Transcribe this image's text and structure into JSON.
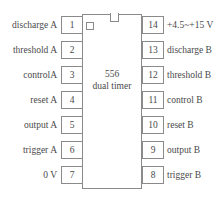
{
  "diagram": {
    "chip": {
      "part_number": "556",
      "description": "dual timer",
      "notch_icon": "notch-indicator",
      "pin1_marker_icon": "pin1-dot-icon"
    },
    "colors": {
      "background": "#ffffff",
      "outline": "#8a8a8a",
      "text": "#4a4a4a"
    },
    "pins_left": [
      {
        "number": "1",
        "label": "discharge A"
      },
      {
        "number": "2",
        "label": "threshold A"
      },
      {
        "number": "3",
        "label": "controlA"
      },
      {
        "number": "4",
        "label": "reset A"
      },
      {
        "number": "5",
        "label": "output A"
      },
      {
        "number": "6",
        "label": "trigger A"
      },
      {
        "number": "7",
        "label": "0 V"
      }
    ],
    "pins_right": [
      {
        "number": "14",
        "label": "+4.5~+15 V"
      },
      {
        "number": "13",
        "label": "discharge B"
      },
      {
        "number": "12",
        "label": "threshold B"
      },
      {
        "number": "11",
        "label": "control B"
      },
      {
        "number": "10",
        "label": "reset B"
      },
      {
        "number": "9",
        "label": "output B"
      },
      {
        "number": "8",
        "label": "trigger B"
      }
    ]
  }
}
